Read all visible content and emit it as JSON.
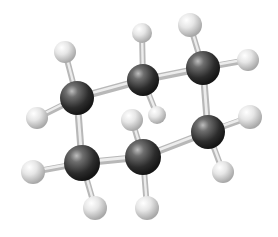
{
  "diagram": {
    "colors": {
      "carbon": "#2a2a2a",
      "hydrogen": "#d8d8d8",
      "bond": "#c8c8c8",
      "background": "#ffffff"
    },
    "carbons": [
      {
        "id": "C1",
        "x": 77,
        "y": 98,
        "r": 17
      },
      {
        "id": "C2",
        "x": 143,
        "y": 80,
        "r": 16
      },
      {
        "id": "C3",
        "x": 203,
        "y": 68,
        "r": 17
      },
      {
        "id": "C4",
        "x": 208,
        "y": 132,
        "r": 17
      },
      {
        "id": "C5",
        "x": 143,
        "y": 157,
        "r": 18
      },
      {
        "id": "C6",
        "x": 82,
        "y": 163,
        "r": 18
      }
    ],
    "hydrogens": [
      {
        "id": "H1a",
        "x": 65,
        "y": 52,
        "r": 11,
        "bond": "C1"
      },
      {
        "id": "H1b",
        "x": 37,
        "y": 118,
        "r": 11,
        "bond": "C1"
      },
      {
        "id": "H2a",
        "x": 142,
        "y": 33,
        "r": 10,
        "bond": "C2"
      },
      {
        "id": "H2b",
        "x": 157,
        "y": 115,
        "r": 9,
        "bond": "C2"
      },
      {
        "id": "H3a",
        "x": 190,
        "y": 25,
        "r": 12,
        "bond": "C3"
      },
      {
        "id": "H3b",
        "x": 248,
        "y": 60,
        "r": 11,
        "bond": "C3"
      },
      {
        "id": "H4a",
        "x": 250,
        "y": 117,
        "r": 12,
        "bond": "C4"
      },
      {
        "id": "H4b",
        "x": 223,
        "y": 172,
        "r": 11,
        "bond": "C4"
      },
      {
        "id": "H5a",
        "x": 132,
        "y": 120,
        "r": 11,
        "bond": "C5"
      },
      {
        "id": "H5b",
        "x": 147,
        "y": 208,
        "r": 12,
        "bond": "C5"
      },
      {
        "id": "H6a",
        "x": 33,
        "y": 172,
        "r": 12,
        "bond": "C6"
      },
      {
        "id": "H6b",
        "x": 95,
        "y": 208,
        "r": 12,
        "bond": "C6"
      }
    ],
    "ring_bonds": [
      [
        "C1",
        "C2"
      ],
      [
        "C2",
        "C3"
      ],
      [
        "C3",
        "C4"
      ],
      [
        "C4",
        "C5"
      ],
      [
        "C5",
        "C6"
      ],
      [
        "C6",
        "C1"
      ]
    ]
  }
}
